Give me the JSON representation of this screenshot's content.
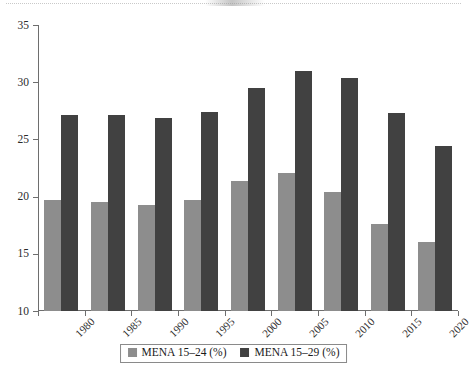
{
  "chart_data": {
    "type": "bar",
    "title": "",
    "subtitle": "",
    "xlabel": "",
    "ylabel": "",
    "ylim": [
      10,
      35
    ],
    "yticks": [
      10,
      15,
      20,
      25,
      30,
      35
    ],
    "grid": false,
    "legend_position": "bottom",
    "categories": [
      "1980",
      "1985",
      "1990",
      "1995",
      "2000",
      "2005",
      "2010",
      "2015",
      "2020"
    ],
    "series": [
      {
        "name": "MENA 15–24 (%)",
        "color": "#8d8d8d",
        "values": [
          19.7,
          19.5,
          19.3,
          19.7,
          21.4,
          22.1,
          20.4,
          17.6,
          16.0
        ]
      },
      {
        "name": "MENA 15–29 (%)",
        "color": "#414141",
        "values": [
          27.1,
          27.1,
          26.9,
          27.4,
          29.5,
          31.0,
          30.4,
          27.3,
          24.4
        ]
      }
    ]
  },
  "legend": {
    "items": [
      {
        "label": "MENA 15–24 (%)",
        "swatch_name": "legend-swatch-mena-15-24"
      },
      {
        "label": "MENA 15–29 (%)",
        "swatch_name": "legend-swatch-mena-15-29"
      }
    ]
  },
  "axis": {
    "y_tick_labels": [
      "35",
      "30",
      "25",
      "20",
      "15",
      "10"
    ],
    "x_tick_labels": [
      "1980",
      "1985",
      "1990",
      "1995",
      "2000",
      "2005",
      "2010",
      "2015",
      "2020"
    ]
  }
}
